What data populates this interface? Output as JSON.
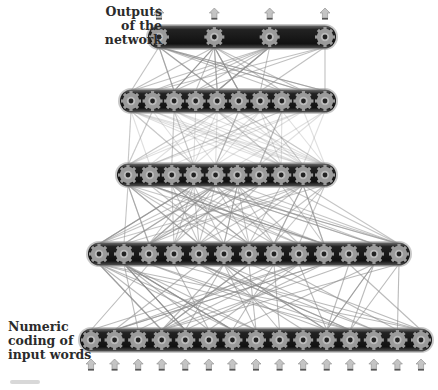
{
  "labels": {
    "outputs": [
      "Outputs",
      "of the",
      "network"
    ],
    "inputs": [
      "Numeric",
      "coding of",
      "input words"
    ]
  },
  "colors": {
    "bar": "#1a1a1a",
    "bar_edge": "#7a7a7a",
    "gear": "#9a9a9a",
    "gear_hub": "#2a2a2a",
    "arrow": "#bdbdbd",
    "arrow_base": "#555555",
    "connection": "#8c8c8c"
  },
  "layers": [
    {
      "name": "output-layer",
      "x0": 148,
      "x1": 336,
      "y": 37,
      "gears": [
        156,
        212,
        265,
        316
      ]
    },
    {
      "name": "hidden-layer-3",
      "x0": 120,
      "x1": 336,
      "y": 101,
      "gears": [
        130,
        152,
        177,
        201,
        225,
        249,
        273,
        297,
        321,
        329
      ]
    },
    {
      "name": "hidden-layer-2",
      "x0": 117,
      "x1": 336,
      "y": 175,
      "gears": [
        128,
        152,
        176,
        200,
        224,
        248,
        272,
        296,
        320,
        330
      ]
    },
    {
      "name": "hidden-layer-1",
      "x0": 88,
      "x1": 410,
      "y": 254,
      "gears": [
        107,
        135,
        160,
        192,
        223,
        254,
        281,
        308,
        338,
        365,
        395,
        403,
        401
      ]
    },
    {
      "name": "input-layer",
      "x0": 80,
      "x1": 432,
      "y": 340,
      "gears": [
        92,
        117,
        142,
        166,
        191,
        216,
        241,
        265,
        290,
        314,
        339,
        363,
        388,
        413,
        424
      ]
    }
  ],
  "output_arrows": [
    156,
    212,
    265,
    316
  ],
  "input_arrows": [
    92,
    120,
    143,
    167,
    191,
    215,
    240,
    264,
    289,
    313,
    338,
    362,
    387,
    411
  ],
  "connections": {
    "output-hidden3": 34,
    "hidden3-hidden2": 60,
    "hidden2-hidden1": 70,
    "hidden1-input": 60
  }
}
